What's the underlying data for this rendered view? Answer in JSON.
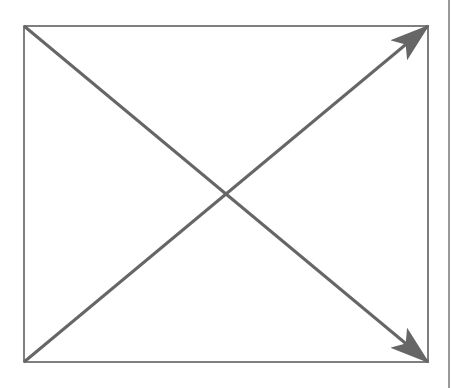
{
  "diagram": {
    "type": "rectangle-with-diagonal-arrows",
    "colors": {
      "background": "#ffffff",
      "frame": "#555555",
      "arrow": "#666666",
      "edge_line": "#555555"
    },
    "frame": {
      "x": 24,
      "y": 26,
      "width": 404,
      "height": 336
    },
    "arrows": [
      {
        "name": "diagonal-arrow-top-left-to-bottom-right",
        "from": [
          24,
          26
        ],
        "to": [
          428,
          362
        ],
        "head": "end"
      },
      {
        "name": "diagonal-arrow-bottom-left-to-top-right",
        "from": [
          24,
          362
        ],
        "to": [
          428,
          26
        ],
        "head": "end"
      }
    ],
    "intersection": [
      226,
      194
    ],
    "right_edge_line_x": 449
  }
}
